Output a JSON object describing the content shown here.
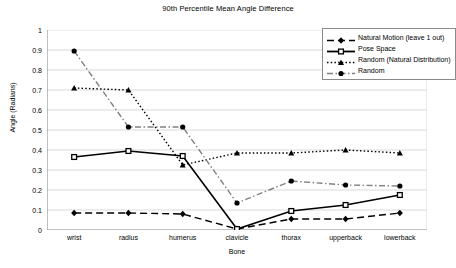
{
  "chart_data": {
    "type": "line",
    "title": "90th Percentile Mean Angle Difference",
    "xlabel": "Bone",
    "ylabel": "Angle (Radians)",
    "categories": [
      "wrist",
      "radius",
      "humerus",
      "clavicle",
      "thorax",
      "upperback",
      "lowerback"
    ],
    "ylim": [
      0,
      1
    ],
    "yticks": [
      "0",
      "0.1",
      "0.2",
      "0.3",
      "0.4",
      "0.5",
      "0.6",
      "0.7",
      "0.8",
      "0.9",
      "1"
    ],
    "grid": true,
    "legend_position": "top-right",
    "series": [
      {
        "name": "Natural Motion (leave 1 out)",
        "values": [
          0.085,
          0.085,
          0.08,
          0.005,
          0.055,
          0.055,
          0.085
        ],
        "color": "#000000",
        "marker": "diamond",
        "dash": "dashed"
      },
      {
        "name": "Pose Space",
        "values": [
          0.365,
          0.395,
          0.37,
          0.005,
          0.095,
          0.125,
          0.175
        ],
        "color": "#000000",
        "marker": "square",
        "dash": "solid"
      },
      {
        "name": "Random (Natural Distribution)",
        "values": [
          0.71,
          0.7,
          0.325,
          0.385,
          0.385,
          0.4,
          0.385
        ],
        "color": "#000000",
        "marker": "triangle",
        "dash": "dotted"
      },
      {
        "name": "Random",
        "values": [
          0.895,
          0.515,
          0.515,
          0.135,
          0.245,
          0.225,
          0.22
        ],
        "color": "#808080",
        "marker": "circle",
        "dash": "dashdot"
      }
    ]
  }
}
